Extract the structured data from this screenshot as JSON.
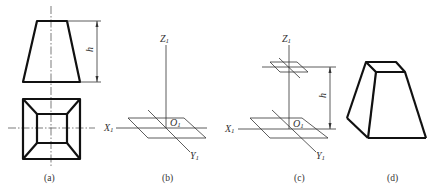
{
  "figure": {
    "panels": [
      {
        "id": "a",
        "label": "(a)",
        "description": "Front and top orthographic views of a frustum of a square pyramid"
      },
      {
        "id": "b",
        "label": "(b)",
        "description": "Axonometric axes X1, Y1, Z1 with origin O1 and base plane"
      },
      {
        "id": "c",
        "label": "(c)",
        "description": "Axes with base plane and top plane raised by height h"
      },
      {
        "id": "d",
        "label": "(d)",
        "description": "Completed axonometric drawing of the frustum"
      }
    ],
    "axis_labels": {
      "x": "X",
      "y": "Y",
      "z": "Z",
      "origin": "O",
      "subscript": "1"
    },
    "dimension_label": "h"
  }
}
